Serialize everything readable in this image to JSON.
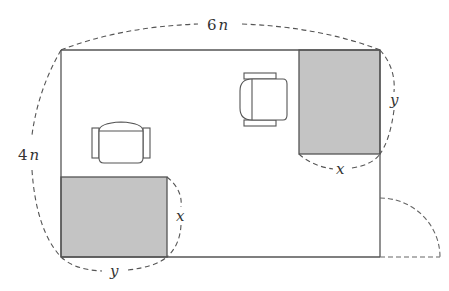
{
  "diagram": {
    "colors": {
      "line": "#555555",
      "dashed": "#555555",
      "shade": "#c4c4c4",
      "background": "#ffffff"
    },
    "room": {
      "width_label": "6n",
      "width_label_coef": "6",
      "width_label_var": "n",
      "height_label": "4n",
      "height_label_coef": "4",
      "height_label_var": "n"
    },
    "shaded_regions": [
      {
        "position": "bottom-left",
        "width_label": "y",
        "height_label": "x"
      },
      {
        "position": "top-right",
        "width_label": "x",
        "height_label": "y"
      }
    ],
    "furniture": [
      {
        "type": "armchair",
        "orientation": "back-top"
      },
      {
        "type": "armchair",
        "orientation": "back-left"
      }
    ],
    "door": {
      "position": "right wall, bottom",
      "swing": "quarter-circle"
    }
  }
}
